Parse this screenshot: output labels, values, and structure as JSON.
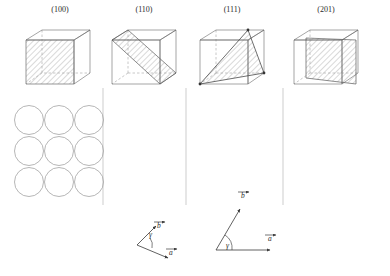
{
  "figure": {
    "type": "crystallographic-planes-diagram",
    "background": "#ffffff",
    "line_color": "#555555",
    "hatch_color": "#777777",
    "circle_color": "#8a8a8a"
  },
  "columns": [
    {
      "index": 0,
      "label": "(100)",
      "label_x": 60,
      "label_y": 6,
      "cube": {
        "cx": 58,
        "cy": 52,
        "plane": "left-face",
        "plane_type": "square"
      },
      "packing": {
        "name": "square-lattice",
        "rows": [
          {
            "y": 120,
            "cx": [
              29,
              59,
              89
            ],
            "r": 14.5
          },
          {
            "y": 151,
            "cx": [
              29,
              59,
              89
            ],
            "r": 14.5
          },
          {
            "y": 182,
            "cx": [
              29,
              59,
              89
            ],
            "r": 14.5
          }
        ]
      }
    },
    {
      "index": 1,
      "label": "(110)",
      "label_x": 144,
      "label_y": 6,
      "cube": {
        "cx": 144,
        "cy": 52,
        "plane": "diagonal-vertical",
        "plane_type": "rectangle"
      },
      "packing": {
        "name": "centered-rectangular-lattice",
        "rows": [
          {
            "y": 120,
            "cx": [
              116,
              146,
              176
            ],
            "r": 15.5
          },
          {
            "y": 135,
            "cx": [
              131,
              161
            ],
            "r": 15.5
          },
          {
            "y": 151,
            "cx": [
              116,
              146,
              176
            ],
            "r": 15.5
          },
          {
            "y": 166,
            "cx": [
              131,
              161
            ],
            "r": 15.5
          },
          {
            "y": 182,
            "cx": [
              116,
              146,
              176
            ],
            "r": 15.5
          }
        ]
      }
    },
    {
      "index": 2,
      "label": "(111)",
      "label_x": 232,
      "label_y": 6,
      "cube": {
        "cx": 232,
        "cy": 52,
        "plane": "corner-triangle",
        "plane_type": "triangle"
      },
      "packing": {
        "name": "hexagonal-lattice",
        "rows": [
          {
            "y": 120,
            "cx": [
              209,
              253
            ],
            "r": 16
          },
          {
            "y": 155,
            "cx": [
              187,
              231,
              275
            ],
            "r": 16
          },
          {
            "y": 190,
            "cx": [
              209,
              253
            ],
            "r": 16
          }
        ]
      }
    },
    {
      "index": 3,
      "label": "(201)",
      "label_x": 326,
      "label_y": 6,
      "cube": {
        "cx": 330,
        "cy": 52,
        "plane": "inclined",
        "plane_type": "rectangle"
      },
      "packing": {
        "name": "wide-row-lattice",
        "rows": [
          {
            "y": 120,
            "cx": [
              305,
              333,
              361
            ],
            "r": 14
          },
          {
            "y": 190,
            "cx": [
              305,
              333,
              361
            ],
            "r": 14
          }
        ]
      }
    }
  ],
  "dividers": [
    {
      "x": 103,
      "y1": 88,
      "y2": 205
    },
    {
      "x": 186,
      "y1": 88,
      "y2": 205
    },
    {
      "x": 283,
      "y1": 88,
      "y2": 205
    }
  ],
  "vector_diagrams": [
    {
      "name": "oblique-cell-vectors",
      "origin_x": 137,
      "origin_y": 245,
      "vectors": [
        {
          "label": "b",
          "label_x": 159,
          "label_y": 214,
          "tip_x": 156,
          "tip_y": 226
        },
        {
          "label": "a",
          "label_x": 171,
          "label_y": 253,
          "tip_x": 168,
          "tip_y": 258
        }
      ],
      "angle_label": "γ",
      "angle_label_x": 150,
      "angle_label_y": 231
    },
    {
      "name": "rectangular-cell-vectors",
      "origin_x": 216,
      "origin_y": 250,
      "vectors": [
        {
          "label": "b",
          "label_x": 243,
          "label_y": 196,
          "tip_x": 240,
          "tip_y": 209
        },
        {
          "label": "a",
          "label_x": 272,
          "label_y": 238,
          "tip_x": 270,
          "tip_y": 250
        }
      ],
      "angle_label": "γ",
      "angle_label_x": 227,
      "angle_label_y": 242
    }
  ]
}
